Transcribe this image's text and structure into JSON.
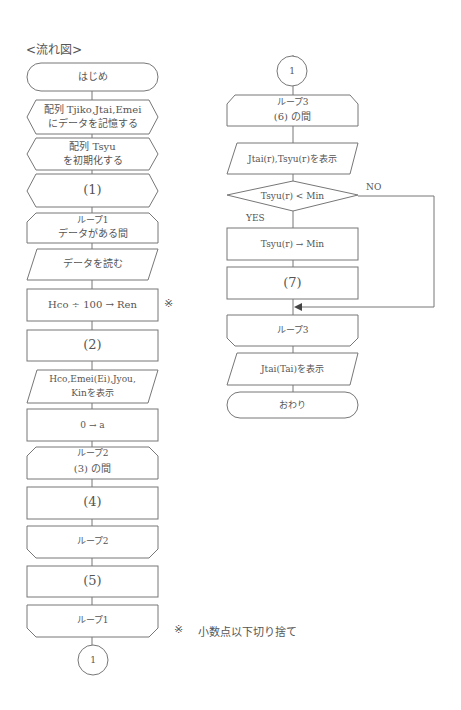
{
  "title": "<流れ図>",
  "left_column": {
    "start": "はじめ",
    "store_arrays_line1": "配列 Tjiko,Jtai,Emei",
    "store_arrays_line2": "にデータを記憶する",
    "init_array_line1": "配列 Tsyu",
    "init_array_line2": "を初期化する",
    "blank1": "(1)",
    "loop1_start_line1": "ループ1",
    "loop1_start_line2": "データがある間",
    "read_data": "データを読む",
    "calc_ren": "Hco ÷ 100 → Ren",
    "calc_ren_mark": "※",
    "blank2": "(2)",
    "display_line1": "Hco,Emei(Ei),Jyou,",
    "display_line2": "Kinを表示",
    "init_a": "0 → a",
    "loop2_start_line1": "ループ2",
    "loop2_start_line2": "(3)  の間",
    "blank4": "(4)",
    "loop2_end": "ループ2",
    "blank5": "(5)",
    "loop1_end": "ループ1",
    "connector": "1"
  },
  "right_column": {
    "connector": "1",
    "loop3_start_line1": "ループ3",
    "loop3_start_line2": "(6)  の間",
    "display_r": "Jtai(r),Tsyu(r)を表示",
    "decision": "Tsyu(r) < Min",
    "decision_no": "NO",
    "decision_yes": "YES",
    "assign_min": "Tsyu(r) → Min",
    "blank7": "(7)",
    "loop3_end": "ループ3",
    "display_tai": "Jtai(Tai)を表示",
    "end": "おわり"
  },
  "footnote": {
    "mark": "※",
    "text": "小数点以下切り捨て"
  }
}
